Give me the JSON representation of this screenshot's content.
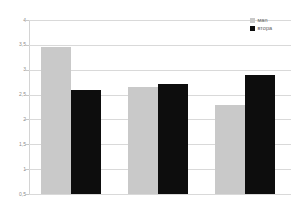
{
  "chart_data": {
    "type": "bar",
    "title": "",
    "subtitle": "",
    "xlabel": "",
    "ylabel": "",
    "categories": [
      "1",
      "2",
      "3"
    ],
    "series": [
      {
        "name": "маn",
        "color": "#c9c9c9",
        "values": [
          3.45,
          2.65,
          2.3
        ]
      },
      {
        "name": "втора",
        "color": "#0d0d0d",
        "values": [
          2.6,
          2.72,
          2.9
        ]
      }
    ],
    "ylim": [
      0.5,
      4
    ],
    "y_ticks": [
      4,
      3.5,
      3,
      2.5,
      2,
      1.5,
      1,
      0.5
    ],
    "y_tick_labels": [
      "4",
      "3,5",
      "3",
      "2,5",
      "2",
      "1,5",
      "1",
      "0,5"
    ],
    "grid": "horizontal",
    "legend_position": "top-right",
    "x_tick_labels_visible": false
  },
  "legend": {
    "items": [
      {
        "label": "маn",
        "swatch": "legend-swatch-man"
      },
      {
        "label": "втора",
        "swatch": "legend-swatch-vtora"
      }
    ]
  },
  "colors": {
    "series_1": "#c9c9c9",
    "series_2": "#0d0d0d",
    "gridline": "#d9d9d9",
    "axis": "#d4d4d4",
    "tick_text": "#8c8c8c",
    "legend_text": "#5e5e5e",
    "background": "#ffffff"
  }
}
